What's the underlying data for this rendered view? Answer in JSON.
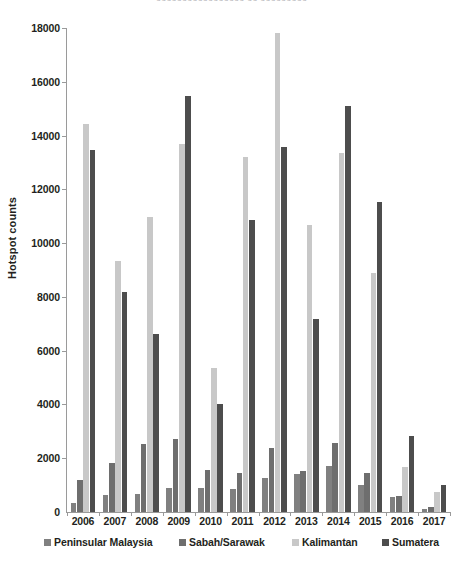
{
  "figure": {
    "top_clipped_caption": "ooooooooooooooooo  oo  ooooooooo",
    "background": "#ffffff"
  },
  "chart_data": {
    "type": "bar",
    "title": "",
    "subtitle": "",
    "xlabel": "",
    "ylabel": "Hotspot counts",
    "categories": [
      "2006",
      "2007",
      "2008",
      "2009",
      "2010",
      "2011",
      "2012",
      "2013",
      "2014",
      "2015",
      "2016",
      "2017"
    ],
    "ylim": [
      0,
      18000
    ],
    "yticks": [
      0,
      2000,
      4000,
      6000,
      8000,
      10000,
      12000,
      14000,
      16000,
      18000
    ],
    "ytick_labels": [
      "0",
      "2000",
      "4000",
      "6000",
      "8000",
      "10000",
      "12000",
      "14000",
      "16000",
      "18000"
    ],
    "grid": false,
    "legend_position": "bottom",
    "series": [
      {
        "name": "Peninsular Malaysia",
        "color": "#808080",
        "values": [
          320,
          620,
          660,
          880,
          900,
          850,
          1270,
          1400,
          1700,
          1000,
          540,
          110
        ]
      },
      {
        "name": "Sabah/Sarawak",
        "color": "#6e6e6e",
        "values": [
          1180,
          1820,
          2530,
          2700,
          1570,
          1440,
          2370,
          1530,
          2580,
          1460,
          590,
          200
        ]
      },
      {
        "name": "Kalimantan",
        "color": "#c8c8c8",
        "values": [
          14420,
          9320,
          10990,
          13700,
          5350,
          13200,
          17800,
          10680,
          13340,
          8880,
          1670,
          730
        ]
      },
      {
        "name": "Sumatera",
        "color": "#4d4d4d",
        "values": [
          13480,
          8170,
          6620,
          15470,
          4010,
          10870,
          13590,
          7160,
          15110,
          11540,
          2820,
          1020
        ]
      }
    ]
  },
  "legend": {
    "items": [
      {
        "label": "Peninsular Malaysia",
        "color": "#808080"
      },
      {
        "label": "Sabah/Sarawak",
        "color": "#6e6e6e"
      },
      {
        "label": "Kalimantan",
        "color": "#c8c8c8"
      },
      {
        "label": "Sumatera",
        "color": "#4d4d4d"
      }
    ]
  }
}
